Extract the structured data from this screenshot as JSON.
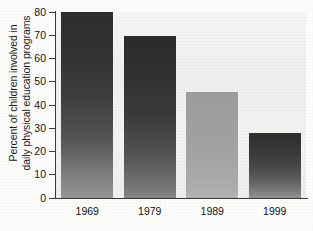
{
  "chart_data": {
    "type": "bar",
    "title": "",
    "subtitle": "",
    "xlabel": "",
    "ylabel_line1": "Percent of children involved in",
    "ylabel_line2": "daily physical education programs",
    "ylabel": "Percent of children involved in daily physical education programs",
    "categories": [
      "1969",
      "1979",
      "1989",
      "1999"
    ],
    "values": [
      80,
      69.5,
      45.5,
      28
    ],
    "series": [
      {
        "name": "Percent of children involved in daily physical education programs",
        "values": [
          80,
          69.5,
          45.5,
          28
        ]
      }
    ],
    "ylim": [
      0,
      80
    ],
    "ytick_labels": [
      "0",
      "10",
      "20",
      "30",
      "40",
      "50",
      "60",
      "70",
      "80"
    ],
    "ytick_values": [
      0,
      10,
      20,
      30,
      40,
      50,
      60,
      70,
      80
    ],
    "grid": false,
    "legend": "none",
    "legend_position": "none",
    "bar_colors": [
      "#3d3d3d",
      "#3a3a3a",
      "#a4a4a4",
      "#4a4a4a"
    ],
    "axis_color": "#3a3a3a",
    "plot_background": "#f1f1ef",
    "page_background": "#fdfdfc"
  }
}
